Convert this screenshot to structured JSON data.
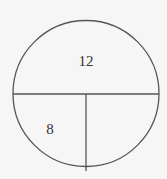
{
  "diagram": {
    "type": "circle divided into regions",
    "regions": [
      {
        "name": "top-half",
        "label": "12"
      },
      {
        "name": "bottom-left-quarter",
        "label": "8"
      },
      {
        "name": "bottom-right-quarter",
        "label": ""
      }
    ]
  },
  "colors": {
    "background": "#f6f6f6",
    "stroke": "#555555",
    "text": "#333333"
  }
}
